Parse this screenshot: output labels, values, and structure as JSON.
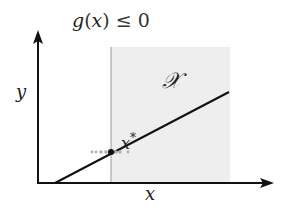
{
  "diagram": {
    "constraint_label": "g(x) ≤ 0",
    "constraint_parts": {
      "g": "g",
      "paren_open": "(",
      "x": "x",
      "paren_close": ")",
      "rel": "≤ 0"
    },
    "feasible_set_label": "𝒳",
    "optimum_label": "x",
    "optimum_superscript": "*",
    "x_axis_label": "x",
    "y_axis_label": "y",
    "colors": {
      "axis": "#111111",
      "line": "#111111",
      "feasible_region": "#eeeeee",
      "boundary": "#999999",
      "point": "#111111",
      "dots": "#aaaaaa"
    }
  }
}
